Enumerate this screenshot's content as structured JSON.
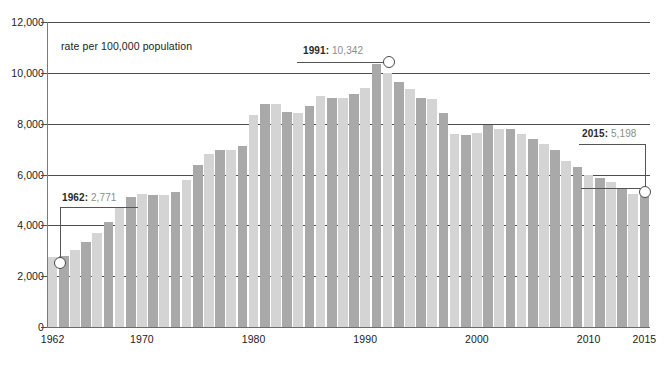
{
  "caption": "rate per 100,000 population",
  "colors": {
    "bar_light": "#d4d4d4",
    "bar_dark": "#a9a9a9",
    "gridline": "#4d4d4d",
    "text": "#1c1c1c",
    "annotation_value": "#8c8c8c",
    "annotation_year": "#2a2a2a"
  },
  "annotations": [
    {
      "id": "anno-1962",
      "year": "1962",
      "value": "2,771",
      "label": "1962: 2,771"
    },
    {
      "id": "anno-1991",
      "year": "1991",
      "value": "10,342",
      "label": "1991: 10,342"
    },
    {
      "id": "anno-2015",
      "year": "2015",
      "value": "5,198",
      "label": "2015: 5,198"
    }
  ],
  "chart_data": {
    "type": "bar",
    "title": "",
    "subtitle": "rate per 100,000 population",
    "xlabel": "",
    "ylabel": "rate per 100,000 population",
    "ylim": [
      0,
      12000
    ],
    "ytick_labels": [
      "0",
      "2,000",
      "4,000",
      "6,000",
      "8,000",
      "10,000",
      "12,000"
    ],
    "yticks": [
      0,
      2000,
      4000,
      6000,
      8000,
      10000,
      12000
    ],
    "xtick_labels": [
      "1962",
      "1970",
      "1980",
      "1990",
      "2000",
      "2010",
      "2015"
    ],
    "xticks": [
      1962,
      1970,
      1980,
      1990,
      2000,
      2010,
      2015
    ],
    "grid": true,
    "legend": "none",
    "bar_alternating_shading": true,
    "categories": [
      1962,
      1963,
      1964,
      1965,
      1966,
      1967,
      1968,
      1969,
      1970,
      1971,
      1972,
      1973,
      1974,
      1975,
      1976,
      1977,
      1978,
      1979,
      1980,
      1981,
      1982,
      1983,
      1984,
      1985,
      1986,
      1987,
      1988,
      1989,
      1990,
      1991,
      1992,
      1993,
      1994,
      1995,
      1996,
      1997,
      1998,
      1999,
      2000,
      2001,
      2002,
      2003,
      2004,
      2005,
      2006,
      2007,
      2008,
      2009,
      2010,
      2011,
      2012,
      2013,
      2014,
      2015
    ],
    "values": [
      2771,
      2792,
      3018,
      3335,
      3702,
      4124,
      4668,
      5110,
      5245,
      5188,
      5175,
      5322,
      5790,
      6381,
      6818,
      6964,
      6958,
      7137,
      8357,
      8763,
      8772,
      8467,
      8427,
      8690,
      9075,
      9014,
      9004,
      9186,
      9407,
      10342,
      9983,
      9631,
      9352,
      9010,
      8957,
      8403,
      7593,
      7539,
      7634,
      7931,
      7802,
      7783,
      7596,
      7389,
      7205,
      6946,
      6548,
      6302,
      5972,
      5865,
      5695,
      5448,
      5239,
      5198
    ],
    "annotated_points": [
      {
        "x": 1962,
        "y": 2771,
        "label": "1962: 2,771"
      },
      {
        "x": 1991,
        "y": 10342,
        "label": "1991: 10,342"
      },
      {
        "x": 2015,
        "y": 5198,
        "label": "2015: 5,198"
      }
    ]
  }
}
